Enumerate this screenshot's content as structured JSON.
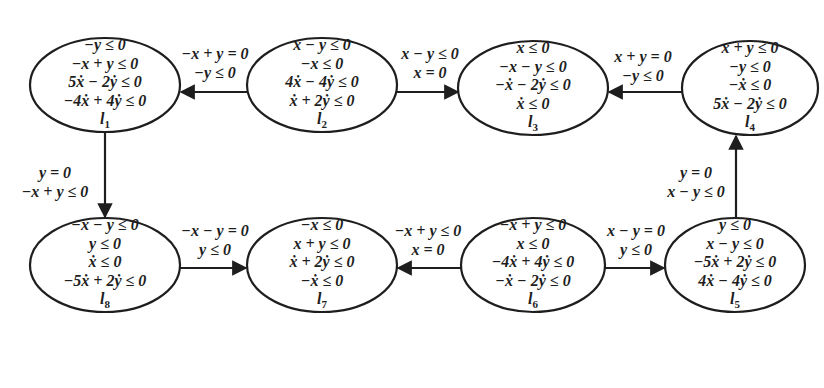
{
  "diagram": {
    "type": "hybrid-automaton",
    "stroke_color": "#1e1e1e",
    "background": "#ffffff",
    "nodes": [
      {
        "id": "l1",
        "label": "l",
        "sub": "1",
        "cx": 105,
        "cy": 85,
        "rx": 75,
        "ry": 47,
        "constraints": [
          "−y ≤ 0",
          "−x + y ≤ 0",
          "5ẋ − 2ẏ ≤ 0",
          "−4ẋ + 4ẏ ≤ 0"
        ]
      },
      {
        "id": "l2",
        "label": "l",
        "sub": "2",
        "cx": 322,
        "cy": 85,
        "rx": 75,
        "ry": 47,
        "constraints": [
          "x − y ≤ 0",
          "−x ≤ 0",
          "4ẋ − 4ẏ ≤ 0",
          "ẋ + 2ẏ ≤ 0"
        ]
      },
      {
        "id": "l3",
        "label": "l",
        "sub": "3",
        "cx": 533,
        "cy": 88,
        "rx": 75,
        "ry": 47,
        "constraints": [
          "x ≤ 0",
          "−x − y ≤ 0",
          "−ẋ − 2ẏ ≤ 0",
          "ẋ ≤ 0"
        ]
      },
      {
        "id": "l4",
        "label": "l",
        "sub": "4",
        "cx": 750,
        "cy": 88,
        "rx": 68,
        "ry": 47,
        "constraints": [
          "x + y ≤ 0",
          "−y ≤ 0",
          "−ẋ ≤ 0",
          "5ẋ − 2ẏ ≤ 0"
        ]
      },
      {
        "id": "l5",
        "label": "l",
        "sub": "5",
        "cx": 735,
        "cy": 265,
        "rx": 70,
        "ry": 47,
        "constraints": [
          "y ≤ 0",
          "x − y ≤ 0",
          "−5ẋ + 2ẏ ≤ 0",
          "4ẋ − 4ẏ ≤ 0"
        ]
      },
      {
        "id": "l6",
        "label": "l",
        "sub": "6",
        "cx": 533,
        "cy": 265,
        "rx": 72,
        "ry": 47,
        "constraints": [
          "−x + y ≤ 0",
          "x ≤ 0",
          "−4ẋ + 4ẏ ≤ 0",
          "−ẋ − 2ẏ ≤ 0"
        ]
      },
      {
        "id": "l7",
        "label": "l",
        "sub": "7",
        "cx": 322,
        "cy": 265,
        "rx": 75,
        "ry": 47,
        "constraints": [
          "−x ≤ 0",
          "x + y ≤ 0",
          "ẋ + 2ẏ ≤ 0",
          "−ẋ ≤ 0"
        ]
      },
      {
        "id": "l8",
        "label": "l",
        "sub": "8",
        "cx": 105,
        "cy": 265,
        "rx": 75,
        "ry": 47,
        "constraints": [
          "−x − y ≤ 0",
          "y ≤ 0",
          "ẋ ≤ 0",
          "−5ẋ + 2ẏ ≤ 0"
        ]
      }
    ],
    "edges": [
      {
        "from": "l2",
        "to": "l1",
        "guard": [
          "−x + y = 0",
          "−y ≤ 0"
        ]
      },
      {
        "from": "l2",
        "to": "l3",
        "guard": [
          "x − y ≤ 0",
          "x = 0"
        ]
      },
      {
        "from": "l4",
        "to": "l3",
        "guard": [
          "x + y = 0",
          "−y ≤ 0"
        ]
      },
      {
        "from": "l1",
        "to": "l8",
        "guard": [
          "y = 0",
          "−x + y ≤ 0"
        ]
      },
      {
        "from": "l8",
        "to": "l7",
        "guard": [
          "−x − y = 0",
          "y ≤ 0"
        ]
      },
      {
        "from": "l6",
        "to": "l7",
        "guard": [
          "−x + y ≤ 0",
          "x = 0"
        ]
      },
      {
        "from": "l6",
        "to": "l5",
        "guard": [
          "x − y = 0",
          "y ≤ 0"
        ]
      },
      {
        "from": "l5",
        "to": "l4",
        "guard": [
          "y = 0",
          "x − y ≤ 0"
        ]
      }
    ]
  }
}
